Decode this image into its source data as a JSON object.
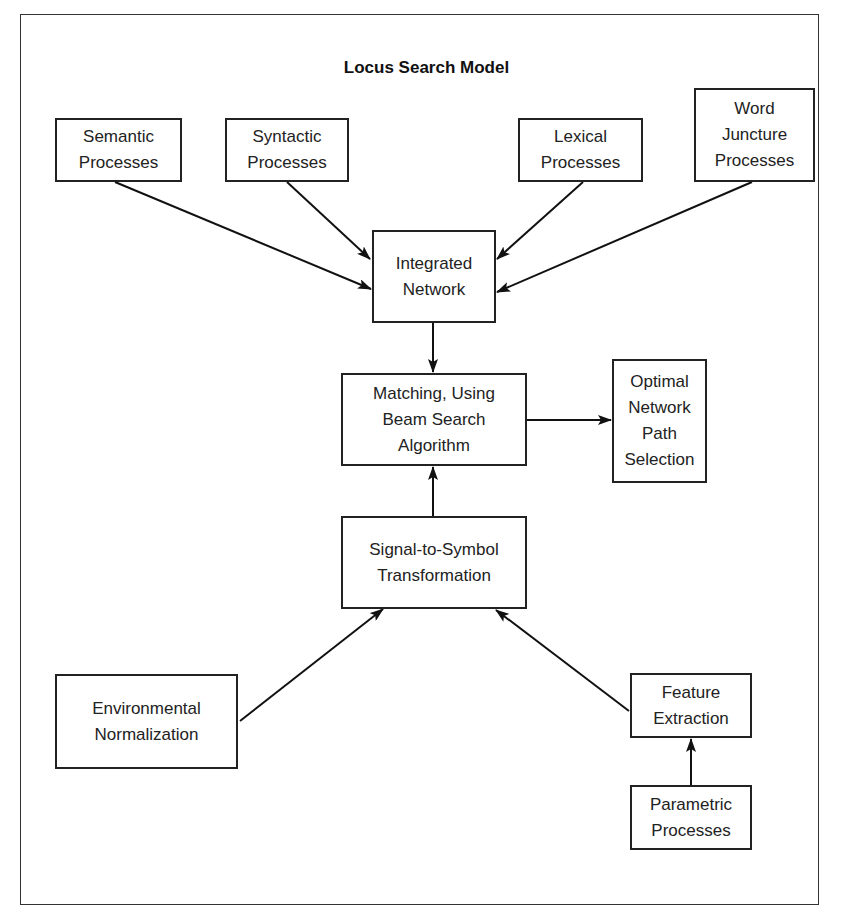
{
  "diagram": {
    "title": "Locus Search Model",
    "nodes": [
      {
        "id": "semantic",
        "lines": [
          "Semantic",
          "Processes"
        ]
      },
      {
        "id": "syntactic",
        "lines": [
          "Syntactic",
          "Processes"
        ]
      },
      {
        "id": "lexical",
        "lines": [
          "Lexical",
          "Processes"
        ]
      },
      {
        "id": "word-juncture",
        "lines": [
          "Word",
          "Juncture",
          "Processes"
        ]
      },
      {
        "id": "integrated-network",
        "lines": [
          "Integrated",
          "Network"
        ]
      },
      {
        "id": "matching",
        "lines": [
          "Matching, Using",
          "Beam Search",
          "Algorithm"
        ]
      },
      {
        "id": "optimal-path",
        "lines": [
          "Optimal",
          "Network",
          "Path",
          "Selection"
        ]
      },
      {
        "id": "signal-to-symbol",
        "lines": [
          "Signal-to-Symbol",
          "Transformation"
        ]
      },
      {
        "id": "environmental",
        "lines": [
          "Environmental",
          "Normalization"
        ]
      },
      {
        "id": "feature-extraction",
        "lines": [
          "Feature",
          "Extraction"
        ]
      },
      {
        "id": "parametric",
        "lines": [
          "Parametric",
          "Processes"
        ]
      }
    ],
    "edges": [
      {
        "from": "semantic",
        "to": "integrated-network"
      },
      {
        "from": "syntactic",
        "to": "integrated-network"
      },
      {
        "from": "lexical",
        "to": "integrated-network"
      },
      {
        "from": "word-juncture",
        "to": "integrated-network"
      },
      {
        "from": "integrated-network",
        "to": "matching"
      },
      {
        "from": "matching",
        "to": "optimal-path"
      },
      {
        "from": "signal-to-symbol",
        "to": "matching"
      },
      {
        "from": "environmental",
        "to": "signal-to-symbol"
      },
      {
        "from": "feature-extraction",
        "to": "signal-to-symbol"
      },
      {
        "from": "parametric",
        "to": "feature-extraction"
      }
    ]
  }
}
